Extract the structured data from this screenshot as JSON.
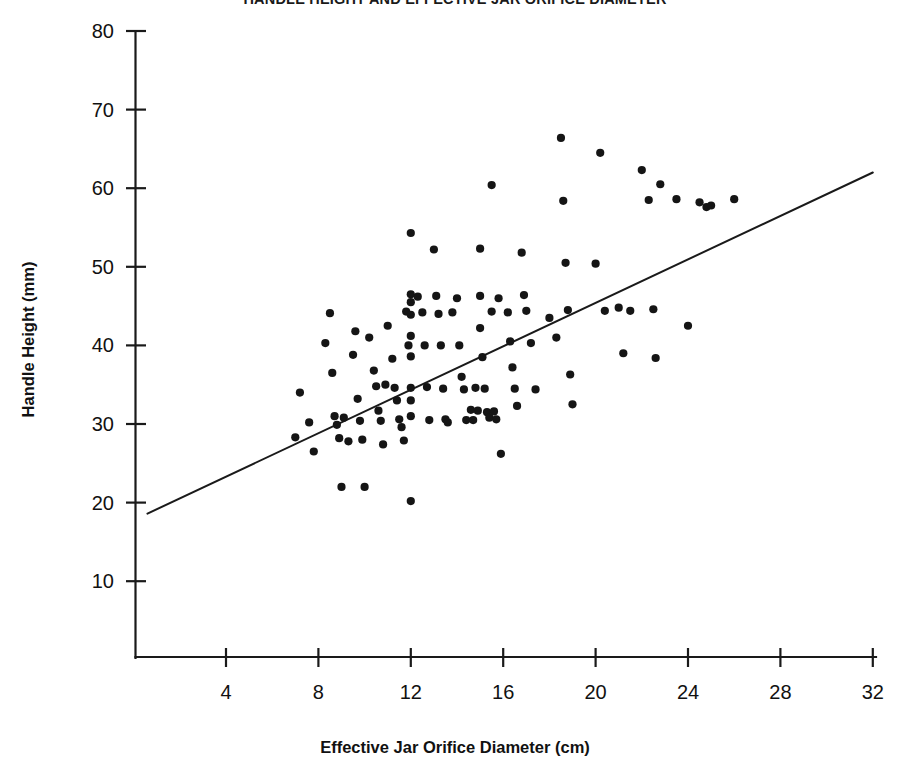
{
  "chart_data": {
    "type": "scatter",
    "title": "HANDLE HEIGHT AND EFFECTIVE JAR ORIFICE DIAMETER",
    "xlabel": "Effective Jar Orifice Diameter (cm)",
    "ylabel": "Handle Height (mm)",
    "xlim": [
      0.5,
      32.8
    ],
    "ylim": [
      0.5,
      80.5
    ],
    "xticks": [
      4,
      8,
      12,
      16,
      20,
      24,
      28,
      32
    ],
    "yticks": [
      10,
      20,
      30,
      40,
      50,
      60,
      70,
      80
    ],
    "xtick_labels": [
      "4",
      "8",
      "12",
      "16",
      "20",
      "24",
      "28",
      "32"
    ],
    "ytick_labels": [
      "10",
      "20",
      "30",
      "40",
      "50",
      "60",
      "70",
      "80"
    ],
    "grid": false,
    "legend": "none",
    "marker": "filled-circle",
    "marker_color": "#151515",
    "n_points": 118,
    "series": [
      {
        "name": "Jars",
        "points": [
          [
            7.0,
            28.3
          ],
          [
            7.2,
            34.0
          ],
          [
            7.6,
            30.2
          ],
          [
            7.8,
            26.5
          ],
          [
            8.3,
            40.3
          ],
          [
            8.5,
            44.1
          ],
          [
            8.6,
            36.5
          ],
          [
            8.7,
            31.0
          ],
          [
            8.8,
            29.9
          ],
          [
            8.9,
            28.2
          ],
          [
            9.0,
            22.0
          ],
          [
            9.1,
            30.8
          ],
          [
            9.3,
            27.8
          ],
          [
            9.5,
            38.8
          ],
          [
            9.6,
            41.8
          ],
          [
            9.7,
            33.2
          ],
          [
            9.8,
            30.4
          ],
          [
            9.9,
            28.0
          ],
          [
            10.0,
            22.0
          ],
          [
            10.2,
            41.0
          ],
          [
            10.4,
            36.8
          ],
          [
            10.5,
            34.8
          ],
          [
            10.6,
            31.7
          ],
          [
            10.7,
            30.4
          ],
          [
            10.8,
            27.4
          ],
          [
            10.9,
            35.0
          ],
          [
            11.0,
            42.5
          ],
          [
            11.2,
            38.3
          ],
          [
            11.3,
            34.6
          ],
          [
            11.4,
            33.0
          ],
          [
            11.5,
            30.6
          ],
          [
            11.6,
            29.6
          ],
          [
            11.7,
            27.9
          ],
          [
            11.8,
            44.3
          ],
          [
            11.9,
            40.0
          ],
          [
            12.0,
            54.3
          ],
          [
            12.0,
            46.5
          ],
          [
            12.0,
            45.5
          ],
          [
            12.0,
            43.9
          ],
          [
            12.0,
            41.2
          ],
          [
            12.0,
            38.6
          ],
          [
            12.0,
            34.6
          ],
          [
            12.0,
            33.0
          ],
          [
            12.0,
            31.0
          ],
          [
            12.0,
            20.2
          ],
          [
            12.3,
            46.2
          ],
          [
            12.5,
            44.2
          ],
          [
            12.6,
            40.0
          ],
          [
            12.7,
            34.7
          ],
          [
            12.8,
            30.5
          ],
          [
            13.0,
            52.2
          ],
          [
            13.1,
            46.3
          ],
          [
            13.2,
            44.0
          ],
          [
            13.3,
            40.0
          ],
          [
            13.4,
            34.5
          ],
          [
            13.5,
            30.6
          ],
          [
            13.6,
            30.2
          ],
          [
            13.8,
            44.2
          ],
          [
            14.0,
            46.0
          ],
          [
            14.1,
            40.0
          ],
          [
            14.2,
            36.0
          ],
          [
            14.3,
            34.4
          ],
          [
            14.4,
            30.5
          ],
          [
            14.6,
            31.8
          ],
          [
            14.7,
            30.5
          ],
          [
            14.8,
            34.6
          ],
          [
            14.9,
            31.7
          ],
          [
            15.0,
            52.3
          ],
          [
            15.0,
            46.3
          ],
          [
            15.0,
            42.2
          ],
          [
            15.1,
            38.5
          ],
          [
            15.2,
            34.5
          ],
          [
            15.3,
            31.5
          ],
          [
            15.4,
            30.8
          ],
          [
            15.5,
            60.4
          ],
          [
            15.5,
            44.3
          ],
          [
            15.6,
            31.6
          ],
          [
            15.7,
            30.6
          ],
          [
            15.8,
            46.0
          ],
          [
            15.9,
            26.2
          ],
          [
            16.2,
            44.2
          ],
          [
            16.3,
            40.5
          ],
          [
            16.4,
            37.2
          ],
          [
            16.5,
            34.5
          ],
          [
            16.6,
            32.3
          ],
          [
            16.8,
            51.8
          ],
          [
            16.9,
            46.4
          ],
          [
            17.0,
            44.4
          ],
          [
            17.2,
            40.3
          ],
          [
            17.4,
            34.4
          ],
          [
            18.0,
            43.5
          ],
          [
            18.3,
            41.0
          ],
          [
            18.5,
            66.4
          ],
          [
            18.6,
            58.4
          ],
          [
            18.7,
            50.5
          ],
          [
            18.8,
            44.5
          ],
          [
            18.9,
            36.3
          ],
          [
            19.0,
            32.5
          ],
          [
            20.0,
            50.4
          ],
          [
            20.2,
            64.5
          ],
          [
            20.4,
            44.4
          ],
          [
            21.0,
            44.8
          ],
          [
            21.2,
            39.0
          ],
          [
            21.5,
            44.4
          ],
          [
            22.0,
            62.3
          ],
          [
            22.3,
            58.5
          ],
          [
            22.5,
            44.6
          ],
          [
            22.6,
            38.4
          ],
          [
            22.8,
            60.5
          ],
          [
            23.5,
            58.6
          ],
          [
            24.0,
            42.5
          ],
          [
            24.5,
            58.2
          ],
          [
            24.8,
            57.6
          ],
          [
            25.0,
            57.8
          ],
          [
            26.0,
            58.6
          ]
        ]
      }
    ],
    "fit_line": {
      "label": "least-squares regression line",
      "x_start": 0.6,
      "y_start": 18.6,
      "x_end": 32.0,
      "y_end": 62.0
    }
  }
}
